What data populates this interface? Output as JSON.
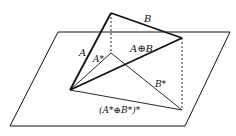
{
  "diagram": {
    "type": "vector-projection",
    "labels": {
      "A": "A",
      "B": "B",
      "A_plus_B": "A⊕B",
      "A_proj": "A*",
      "B_proj": "B*",
      "sum_proj": "(A*⊕B*)*"
    },
    "colors": {
      "line": "#111111",
      "background": "#ffffff"
    }
  }
}
